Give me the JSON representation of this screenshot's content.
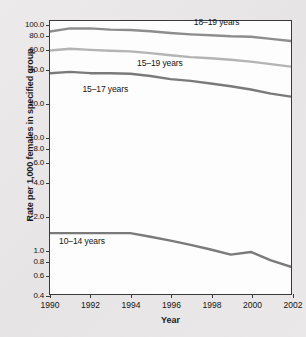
{
  "chart_data": {
    "type": "line",
    "title": "",
    "xlabel": "Year",
    "ylabel": "Rate per 1,000 females in specified group",
    "yscale": "log",
    "ylim": [
      0.4,
      110.0
    ],
    "xlim": [
      1990,
      2002
    ],
    "grid": false,
    "legend_position": "inline-labels",
    "x": [
      1990,
      1991,
      1992,
      1993,
      1994,
      1995,
      1996,
      1997,
      1998,
      1999,
      2000,
      2001,
      2002
    ],
    "ytick_labels": [
      "100.0",
      "80.0",
      "60.0",
      "40.0",
      "20.0",
      "10.0",
      "8.0",
      "6.0",
      "4.0",
      "2.0",
      "1.0",
      "0.8",
      "0.6",
      "0.4"
    ],
    "ytick_values": [
      100.0,
      80.0,
      60.0,
      40.0,
      20.0,
      10.0,
      8.0,
      6.0,
      4.0,
      2.0,
      1.0,
      0.8,
      0.6,
      0.4
    ],
    "xtick_labels": [
      "1990",
      "1992",
      "1994",
      "1996",
      "1998",
      "2000",
      "2002"
    ],
    "xtick_values": [
      1990,
      1992,
      1994,
      1996,
      1998,
      2000,
      2002
    ],
    "series": [
      {
        "name": "18-19 years",
        "label": "18–19 years",
        "color": "#8d8d8d",
        "label_x": 1997.1,
        "label_y": 108.0,
        "values": [
          88.6,
          94.4,
          94.5,
          92.1,
          91.5,
          89.1,
          86.0,
          83.6,
          82.0,
          80.3,
          79.5,
          76.1,
          72.8
        ]
      },
      {
        "name": "15-19 years",
        "label": "15–19 years",
        "color": "#b4b4b4",
        "label_x": 1994.3,
        "label_y": 47.0,
        "values": [
          59.9,
          62.1,
          60.7,
          59.6,
          58.9,
          56.8,
          54.4,
          52.3,
          51.1,
          49.6,
          47.7,
          45.3,
          43.0
        ]
      },
      {
        "name": "15-17 years",
        "label": "15–17 years",
        "color": "#7a7a7a",
        "label_x": 1991.6,
        "label_y": 27.5,
        "values": [
          37.5,
          38.6,
          37.6,
          37.5,
          37.2,
          35.5,
          33.3,
          32.1,
          30.4,
          28.7,
          26.9,
          24.7,
          23.2
        ]
      },
      {
        "name": "10-14 years",
        "label": "10–14 years",
        "color": "#7a7a7a",
        "label_x": 1990.45,
        "label_y": 1.22,
        "values": [
          1.4,
          1.4,
          1.4,
          1.4,
          1.4,
          1.3,
          1.2,
          1.1,
          1.0,
          0.9,
          0.95,
          0.8,
          0.7
        ]
      }
    ]
  },
  "axis": {
    "x_title": "Year",
    "y_title": "Rate per 1,000 females in specified group"
  },
  "caption": ""
}
